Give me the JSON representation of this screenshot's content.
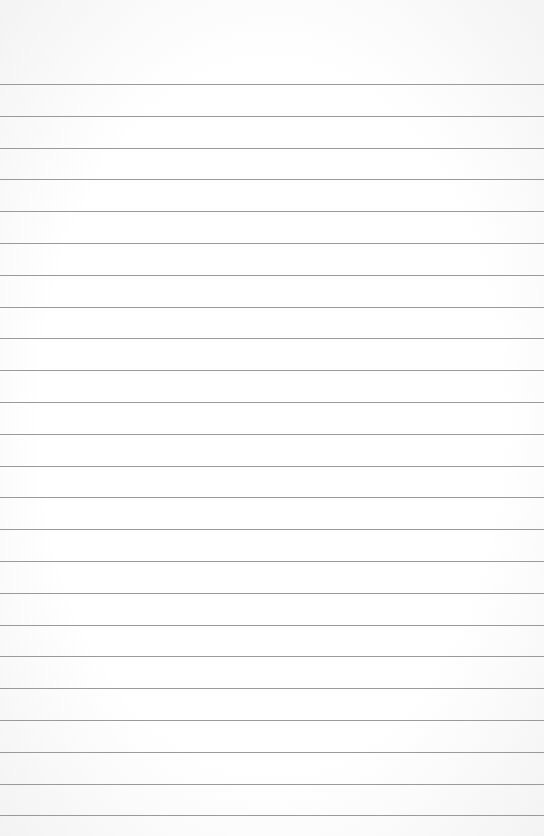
{
  "paper": {
    "type": "lined-paper",
    "background_color": "#fdfdfd",
    "line_color": "#9a9a9a",
    "first_line_y": 84,
    "line_spacing": 31.8,
    "line_count": 24
  }
}
